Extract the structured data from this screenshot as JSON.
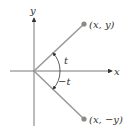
{
  "diagram": {
    "axes": {
      "x_label": "x",
      "y_label": "y"
    },
    "points": [
      {
        "label": "(x, y)",
        "x": 84,
        "y": 24
      },
      {
        "label": "(x, −y)",
        "x": 84,
        "y": 119
      }
    ],
    "angles": {
      "upper": "t",
      "lower": "−t"
    },
    "colors": {
      "ray": "#9a9a9a",
      "point": "#8a8a8a",
      "axis": "#333333"
    }
  }
}
